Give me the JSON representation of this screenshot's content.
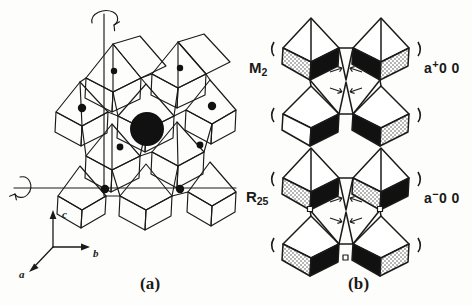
{
  "figure": {
    "panels": [
      {
        "id": "a",
        "caption": "(a)",
        "description": "corner-linked octahedral framework with rotation axes"
      },
      {
        "id": "b",
        "caption": "(b)",
        "description": "octahedral tilt modes"
      }
    ]
  },
  "axes": {
    "c_label": "c",
    "b_label": "b",
    "a_label": "a"
  },
  "modes": [
    {
      "name": "M",
      "subscript": "2",
      "tilt_base": "a",
      "tilt_sign": "+",
      "tilt_rest": "0 0"
    },
    {
      "name": "R",
      "subscript": "25",
      "tilt_base": "a",
      "tilt_sign": "−",
      "tilt_rest": "0 0"
    }
  ],
  "colors": {
    "ink": "#1a1a18",
    "paper": "#fdfdfb",
    "filled_face": "#111111",
    "atom": "#111111"
  }
}
